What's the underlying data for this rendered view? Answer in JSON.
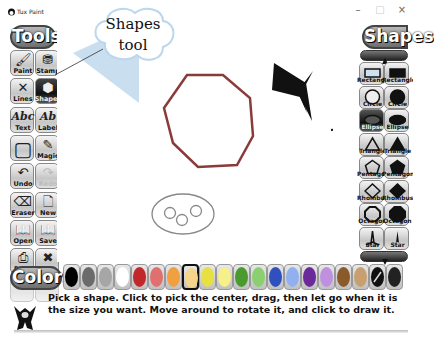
{
  "window": {
    "title": "Tux Paint",
    "controls": {
      "minimize": "–",
      "maximize": "□",
      "close": "×"
    }
  },
  "tools": {
    "header": "Tools",
    "items": [
      {
        "label": "Paint",
        "icon": "paintbrush-icon",
        "glyph": "🖌",
        "state": "normal"
      },
      {
        "label": "Stamp",
        "icon": "stamp-icon",
        "glyph": "⛃",
        "state": "normal"
      },
      {
        "label": "Lines",
        "icon": "lines-icon",
        "glyph": "✕",
        "state": "normal"
      },
      {
        "label": "Shapes",
        "icon": "shapes-icon",
        "glyph": "⬢",
        "state": "active"
      },
      {
        "label": "Text",
        "icon": "text-icon",
        "glyph": "Abc",
        "state": "normal"
      },
      {
        "label": "Label",
        "icon": "label-icon",
        "glyph": "Ab",
        "state": "normal"
      },
      {
        "label": "",
        "icon": "fill-icon",
        "glyph": "▢",
        "state": "normal"
      },
      {
        "label": "Magic",
        "icon": "magic-wand-icon",
        "glyph": "✎",
        "state": "normal"
      },
      {
        "label": "Undo",
        "icon": "undo-icon",
        "glyph": "↶",
        "state": "normal"
      },
      {
        "label": "Redo",
        "icon": "redo-icon",
        "glyph": "↷",
        "state": "disabled"
      },
      {
        "label": "Eraser",
        "icon": "eraser-icon",
        "glyph": "⌫",
        "state": "normal"
      },
      {
        "label": "New",
        "icon": "new-file-icon",
        "glyph": "🗋",
        "state": "normal"
      },
      {
        "label": "Open",
        "icon": "open-icon",
        "glyph": "📖",
        "state": "normal"
      },
      {
        "label": "Save",
        "icon": "save-icon",
        "glyph": "📖",
        "state": "normal"
      },
      {
        "label": "Print",
        "icon": "print-icon",
        "glyph": "⎙",
        "state": "normal"
      },
      {
        "label": "Quit",
        "icon": "quit-icon",
        "glyph": "✖",
        "state": "normal"
      }
    ]
  },
  "shapes": {
    "header": "Shapes",
    "items": [
      {
        "label": "Rectangle",
        "shape": "rect-outline",
        "state": "normal"
      },
      {
        "label": "Rectangle",
        "shape": "rect-filled",
        "state": "normal"
      },
      {
        "label": "Circle",
        "shape": "circle-outline",
        "state": "normal"
      },
      {
        "label": "Circle",
        "shape": "circle-filled",
        "state": "normal"
      },
      {
        "label": "Ellipse",
        "shape": "ellipse-outline",
        "state": "active"
      },
      {
        "label": "Ellipse",
        "shape": "ellipse-filled",
        "state": "normal"
      },
      {
        "label": "Triangle",
        "shape": "triangle-outline",
        "state": "normal"
      },
      {
        "label": "Triangle",
        "shape": "triangle-filled",
        "state": "normal"
      },
      {
        "label": "Pentagon",
        "shape": "pentagon-outline",
        "state": "normal"
      },
      {
        "label": "Pentagon",
        "shape": "pentagon-filled",
        "state": "normal"
      },
      {
        "label": "Rhombus",
        "shape": "rhombus-outline",
        "state": "normal"
      },
      {
        "label": "Rhombus",
        "shape": "rhombus-filled",
        "state": "normal"
      },
      {
        "label": "Octagon",
        "shape": "octagon-outline",
        "state": "normal"
      },
      {
        "label": "Octagon",
        "shape": "octagon-filled",
        "state": "normal"
      },
      {
        "label": "Star",
        "shape": "star-outline",
        "state": "normal"
      },
      {
        "label": "Star",
        "shape": "star-filled",
        "state": "normal"
      }
    ]
  },
  "colors": {
    "header": "Colors",
    "swatches": [
      "#000000",
      "#6b6b6b",
      "#a6a6a6",
      "#ffffff",
      "#c0282a",
      "#e07070",
      "#f0a040",
      "#f5d58a",
      "#e6e040",
      "#f5f08a",
      "#4a9a30",
      "#8ad070",
      "#3050c0",
      "#90b0f0",
      "#6a2a9a",
      "#c090e0",
      "#8a5a2a",
      "#c8a070",
      "#f2f2f2",
      "#222222"
    ],
    "selected_index": 7
  },
  "callout": {
    "line1": "Shapes",
    "line2": "tool"
  },
  "instructions": {
    "text": "Pick a shape. Click to pick the center, drag, then let go when it is the size you want. Move around to rotate it, and click to draw it."
  },
  "canvas": {
    "triangle_color": "#c9dff0",
    "octagon_color": "#8b3a3a",
    "star_color": "#111111",
    "ellipse_color": "#888888"
  }
}
